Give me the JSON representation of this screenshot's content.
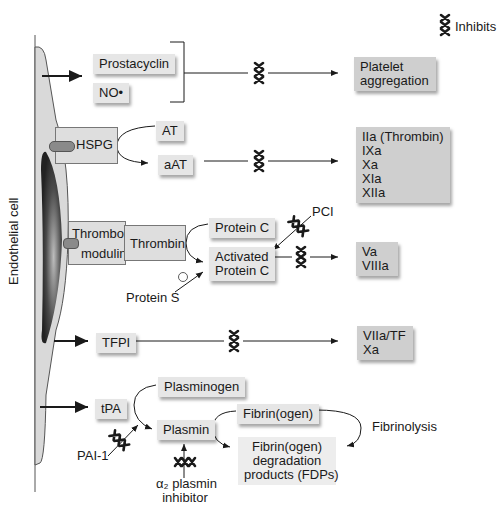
{
  "legend": {
    "symbol": "inhibit-symbol",
    "label": "Inhibits"
  },
  "cell_label": "Endothelial cell",
  "rows": {
    "prostacyclin": {
      "label": "Prostacyclin"
    },
    "no": {
      "label": "NO•"
    },
    "platelet": {
      "lines": [
        "Platelet",
        "aggregation"
      ]
    },
    "hspg": {
      "label": "HSPG"
    },
    "at": {
      "label": "AT"
    },
    "aat": {
      "label": "aAT"
    },
    "factors_thrombin": {
      "lines": [
        "IIa (Thrombin)",
        "IXa",
        "Xa",
        "XIa",
        "XIIa"
      ]
    },
    "thrombomodulin": {
      "lines": [
        "Thrombo-",
        "modulin"
      ]
    },
    "thrombin": {
      "label": "Thrombin"
    },
    "protein_c": {
      "label": "Protein C"
    },
    "activated_protein_c": {
      "lines": [
        "Activated",
        "Protein C"
      ]
    },
    "pci": {
      "label": "PCI"
    },
    "protein_s": {
      "label": "Protein S"
    },
    "plus": {
      "label": "+"
    },
    "va_viiia": {
      "lines": [
        "Va",
        "VIIIa"
      ]
    },
    "tfpi": {
      "label": "TFPI"
    },
    "viia_tf": {
      "lines": [
        "VIIa/TF",
        "Xa"
      ]
    },
    "tpa": {
      "label": "tPA"
    },
    "plasminogen": {
      "label": "Plasminogen"
    },
    "plasmin": {
      "label": "Plasmin"
    },
    "pai1": {
      "label": "PAI-1"
    },
    "alpha2": {
      "lines": [
        "α₂ plasmin",
        "inhibitor"
      ]
    },
    "fibrinogen": {
      "label": "Fibrin(ogen)"
    },
    "fibrinolysis": {
      "label": "Fibrinolysis"
    },
    "fdps": {
      "lines": [
        "Fibrin(ogen)",
        "degradation",
        "products (FDPs)"
      ]
    }
  },
  "colors": {
    "box": "#e6e6e6",
    "box_dark": "#cfcfcf",
    "cell_fill": "#d9d9d9",
    "nucleus": "#3a3a3a",
    "line": "#1a1a1a"
  }
}
